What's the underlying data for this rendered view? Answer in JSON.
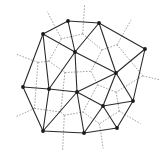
{
  "diagram": {
    "type": "delaunay-voronoi",
    "width": 167,
    "height": 157,
    "colors": {
      "delaunay_edge": "#2a2a2a",
      "voronoi_edge": "#8a8a8a",
      "site": "#1a1a1a",
      "background": "#ffffff"
    },
    "sites": {
      "A": [
        68,
        21
      ],
      "B": [
        99,
        23
      ],
      "C": [
        43,
        34
      ],
      "D": [
        75,
        52
      ],
      "E": [
        145,
        49
      ],
      "F": [
        116,
        73
      ],
      "G": [
        23,
        87
      ],
      "H": [
        49,
        89
      ],
      "I": [
        77,
        92
      ],
      "J": [
        133,
        101
      ],
      "K": [
        103,
        106
      ],
      "L": [
        117,
        128
      ],
      "M": [
        43,
        131
      ],
      "N": [
        84,
        133
      ]
    },
    "delaunay_edges": [
      [
        "A",
        "B"
      ],
      [
        "A",
        "C"
      ],
      [
        "A",
        "D"
      ],
      [
        "B",
        "D"
      ],
      [
        "B",
        "E"
      ],
      [
        "B",
        "F"
      ],
      [
        "C",
        "D"
      ],
      [
        "C",
        "G"
      ],
      [
        "C",
        "H"
      ],
      [
        "D",
        "F"
      ],
      [
        "D",
        "H"
      ],
      [
        "D",
        "I"
      ],
      [
        "E",
        "F"
      ],
      [
        "E",
        "J"
      ],
      [
        "F",
        "I"
      ],
      [
        "F",
        "K"
      ],
      [
        "F",
        "J"
      ],
      [
        "G",
        "H"
      ],
      [
        "G",
        "M"
      ],
      [
        "H",
        "I"
      ],
      [
        "H",
        "M"
      ],
      [
        "I",
        "M"
      ],
      [
        "I",
        "N"
      ],
      [
        "I",
        "K"
      ],
      [
        "K",
        "J"
      ],
      [
        "K",
        "N"
      ],
      [
        "K",
        "L"
      ],
      [
        "J",
        "L"
      ],
      [
        "L",
        "N"
      ],
      [
        "M",
        "N"
      ]
    ],
    "triangles": [
      [
        "A",
        "B",
        "D"
      ],
      [
        "A",
        "C",
        "D"
      ],
      [
        "B",
        "D",
        "F"
      ],
      [
        "B",
        "E",
        "F"
      ],
      [
        "C",
        "D",
        "H"
      ],
      [
        "C",
        "G",
        "H"
      ],
      [
        "D",
        "H",
        "I"
      ],
      [
        "D",
        "I",
        "F"
      ],
      [
        "E",
        "F",
        "J"
      ],
      [
        "F",
        "I",
        "K"
      ],
      [
        "F",
        "K",
        "J"
      ],
      [
        "G",
        "H",
        "M"
      ],
      [
        "H",
        "I",
        "M"
      ],
      [
        "I",
        "M",
        "N"
      ],
      [
        "I",
        "K",
        "N"
      ],
      [
        "K",
        "J",
        "L"
      ],
      [
        "K",
        "L",
        "N"
      ]
    ],
    "ray_length": 18
  }
}
